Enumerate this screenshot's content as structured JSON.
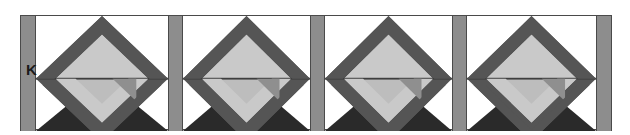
{
  "figure": {
    "width": 630,
    "height": 135,
    "background": "#ffffff"
  },
  "labels": [
    {
      "text": "K",
      "x": 26,
      "y": 62
    }
  ],
  "palette": {
    "background": "#ffffff",
    "rule_line": "#4a4a4a",
    "pilaster_fill": "#8d8d8d",
    "band_dark": "#555555",
    "band_mid": "#6f6f6f",
    "diamond_light": "#c9c9c9",
    "diamond_light_alt": "#bdbdbd",
    "triangle_black": "#2a2a2a",
    "inner_shadow": "#8f8f8f"
  },
  "band": {
    "x": 20,
    "y": 15,
    "width": 592,
    "height": 115,
    "top_rule": true,
    "bottom_rule": true
  },
  "pilasters": [
    {
      "name": "pilaster-1",
      "x": 0,
      "width": 16
    },
    {
      "name": "pilaster-2",
      "x": 148,
      "width": 15
    },
    {
      "name": "pilaster-3",
      "x": 290,
      "width": 15
    },
    {
      "name": "pilaster-4",
      "x": 432,
      "width": 15
    },
    {
      "name": "pilaster-5",
      "x": 576,
      "width": 16
    }
  ],
  "motifs": [
    {
      "name": "motif-1",
      "x": 16,
      "width": 132
    },
    {
      "name": "motif-2",
      "x": 163,
      "width": 127
    },
    {
      "name": "motif-3",
      "x": 305,
      "width": 127
    },
    {
      "name": "motif-4",
      "x": 447,
      "width": 129
    }
  ],
  "motif_description": {
    "shape": "nested lozenge / diamond",
    "layers": [
      "dark outer diamond band",
      "light gray inner diamond field",
      "mid-gray folded chevron overlay",
      "black lower triangle ground"
    ]
  }
}
